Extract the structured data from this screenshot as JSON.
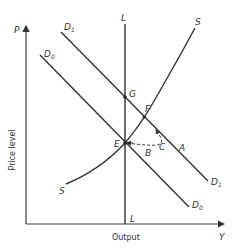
{
  "diagram": {
    "axes": {
      "y_symbol": "P",
      "x_symbol": "Y",
      "y_title": "Price level",
      "x_title": "Output"
    },
    "curves": {
      "D0": {
        "label": "D",
        "subscript": "0"
      },
      "D1": {
        "label": "D",
        "subscript": "1"
      },
      "S": {
        "label": "S"
      },
      "L": {
        "label": "L"
      }
    },
    "points": {
      "G": "G",
      "F": "F",
      "E": "E",
      "B": "B",
      "C": "C",
      "A": "A"
    }
  }
}
